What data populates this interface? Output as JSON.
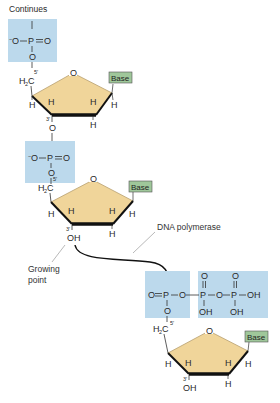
{
  "title": "Continues",
  "colors": {
    "phosphate_box": "#bcd9ec",
    "sugar_fill": "#f0d59a",
    "sugar_edge": "#b8a070",
    "base_box": "#9fc79a",
    "bond": "#333333",
    "arrow": "#111111"
  },
  "labels": {
    "dna_polymerase": "DNA polymerase",
    "growing_point_line1": "Growing",
    "growing_point_line2": "point",
    "base": "Base"
  },
  "atoms": {
    "O": "O",
    "P": "P",
    "H": "H",
    "OH": "OH",
    "O_minus": "O",
    "minus": "−",
    "H2C": "H",
    "H2C_sub": "2",
    "H2C_C": "C",
    "prime5": "5′",
    "prime3": "3′"
  },
  "nucleotides": [
    {
      "position": "top",
      "has_phosphate": true,
      "three_prime": "O"
    },
    {
      "position": "middle",
      "has_phosphate": true,
      "three_prime": "OH"
    },
    {
      "position": "incoming",
      "has_triphosphate": true,
      "three_prime": "OH"
    }
  ]
}
